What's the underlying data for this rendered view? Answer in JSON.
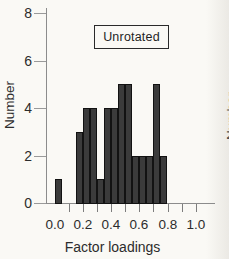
{
  "figure": {
    "panel_label": "Unrotated",
    "y_axis": {
      "label": "Number"
    },
    "x_axis": {
      "label": "Factor loadings"
    },
    "adjacent_panel_fragment_label": "Number"
  },
  "chart_data": {
    "type": "bar",
    "subtype": "histogram",
    "title": "Unrotated",
    "xlabel": "Factor loadings",
    "ylabel": "Number",
    "xlim": [
      0.0,
      1.0
    ],
    "ylim": [
      0,
      8
    ],
    "x_tick_labels": [
      "0.0",
      "0.2",
      "0.4",
      "0.6",
      "0.8",
      "1.0"
    ],
    "x_major_ticks": [
      0.0,
      0.2,
      0.4,
      0.6,
      0.8,
      1.0
    ],
    "x_minor_ticks": [
      0.1,
      0.2,
      0.3,
      0.4,
      0.5,
      0.6,
      0.7,
      0.8,
      0.9,
      1.0
    ],
    "y_ticks": [
      0,
      2,
      4,
      6,
      8
    ],
    "y_tick_labels": [
      "0",
      "2",
      "4",
      "6",
      "8"
    ],
    "grid": false,
    "bin_width": 0.05,
    "bins": [
      {
        "x0": 0.0,
        "count": 1
      },
      {
        "x0": 0.15,
        "count": 3
      },
      {
        "x0": 0.2,
        "count": 4
      },
      {
        "x0": 0.25,
        "count": 4
      },
      {
        "x0": 0.3,
        "count": 1
      },
      {
        "x0": 0.35,
        "count": 4
      },
      {
        "x0": 0.4,
        "count": 4
      },
      {
        "x0": 0.45,
        "count": 5
      },
      {
        "x0": 0.5,
        "count": 5
      },
      {
        "x0": 0.55,
        "count": 2
      },
      {
        "x0": 0.6,
        "count": 2
      },
      {
        "x0": 0.65,
        "count": 2
      },
      {
        "x0": 0.7,
        "count": 5
      },
      {
        "x0": 0.75,
        "count": 2
      }
    ],
    "bar_color": "#3b3b3b",
    "bar_edge_color": "#121212",
    "axis_color": "#8c8c8c",
    "text_color": "#2c2c2c",
    "background_color": "#faf9f5"
  }
}
